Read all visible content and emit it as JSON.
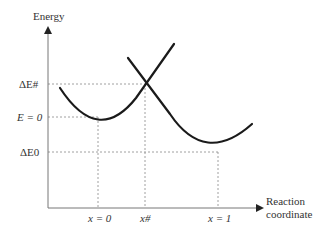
{
  "diagram": {
    "type": "potential-energy-curves",
    "y_axis_label": "Energy",
    "x_axis_label_line1": "Reaction",
    "x_axis_label_line2": "coordinate",
    "energy_levels": {
      "activation": "ΔE#",
      "zero": "E = 0",
      "reaction": "ΔE0"
    },
    "x_ticks": {
      "reactant": "x = 0",
      "transition": "x#",
      "product": "x = 1"
    },
    "curves": [
      {
        "name": "reactant-parabola",
        "minimum_at": "x = 0",
        "minimum_energy": "E = 0"
      },
      {
        "name": "product-parabola",
        "minimum_at": "x = 1",
        "minimum_energy": "ΔE0"
      }
    ],
    "crossing_point": {
      "x": "x#",
      "energy": "ΔE#"
    },
    "colors": {
      "curve": "#1a1a1a",
      "axis": "#666666",
      "guide": "#888888"
    }
  }
}
